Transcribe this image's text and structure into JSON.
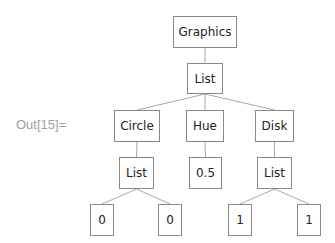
{
  "output_label": "Out[15]=",
  "colors": {
    "edge": "#a8a8a8",
    "border": "#8a8a8a",
    "text": "#222222",
    "label": "#a0a0a0"
  },
  "tree": {
    "nodes": [
      {
        "id": "n0",
        "label": "Graphics",
        "x": 173,
        "y": 16,
        "w": 64,
        "h": 32
      },
      {
        "id": "n1",
        "label": "List",
        "x": 187,
        "y": 63,
        "w": 36,
        "h": 31
      },
      {
        "id": "n2",
        "label": "Circle",
        "x": 114,
        "y": 110,
        "w": 46,
        "h": 32
      },
      {
        "id": "n3",
        "label": "Hue",
        "x": 186,
        "y": 110,
        "w": 38,
        "h": 32
      },
      {
        "id": "n4",
        "label": "Disk",
        "x": 255,
        "y": 110,
        "w": 39,
        "h": 32
      },
      {
        "id": "n5",
        "label": "List",
        "x": 119,
        "y": 157,
        "w": 35,
        "h": 32
      },
      {
        "id": "n6",
        "label": "0.5",
        "x": 189,
        "y": 157,
        "w": 33,
        "h": 32
      },
      {
        "id": "n7",
        "label": "List",
        "x": 257,
        "y": 157,
        "w": 35,
        "h": 32
      },
      {
        "id": "n8",
        "label": "0",
        "x": 90,
        "y": 204,
        "w": 24,
        "h": 32
      },
      {
        "id": "n9",
        "label": "0",
        "x": 158,
        "y": 204,
        "w": 24,
        "h": 32
      },
      {
        "id": "n10",
        "label": "1",
        "x": 228,
        "y": 204,
        "w": 24,
        "h": 32
      },
      {
        "id": "n11",
        "label": "1",
        "x": 297,
        "y": 204,
        "w": 24,
        "h": 32
      }
    ],
    "edges": [
      [
        "n0",
        "n1"
      ],
      [
        "n1",
        "n2"
      ],
      [
        "n1",
        "n3"
      ],
      [
        "n1",
        "n4"
      ],
      [
        "n2",
        "n5"
      ],
      [
        "n3",
        "n6"
      ],
      [
        "n4",
        "n7"
      ],
      [
        "n5",
        "n8"
      ],
      [
        "n5",
        "n9"
      ],
      [
        "n7",
        "n10"
      ],
      [
        "n7",
        "n11"
      ]
    ]
  }
}
